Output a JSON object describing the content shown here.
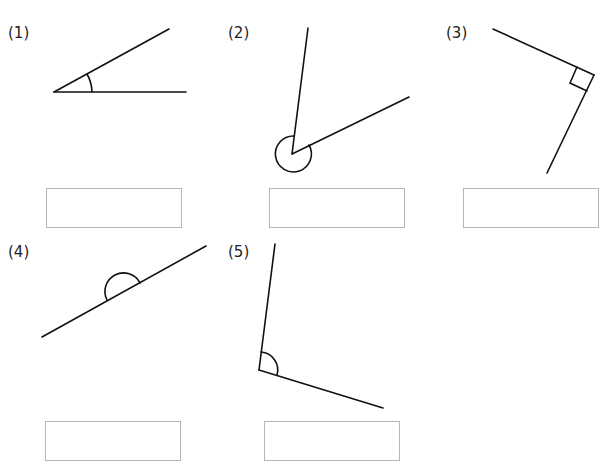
{
  "worksheet": {
    "problems": [
      {
        "number": "(1)",
        "angle_type": "acute",
        "answer": ""
      },
      {
        "number": "(2)",
        "angle_type": "reflex",
        "answer": ""
      },
      {
        "number": "(3)",
        "angle_type": "right",
        "answer": ""
      },
      {
        "number": "(4)",
        "angle_type": "straight",
        "answer": ""
      },
      {
        "number": "(5)",
        "angle_type": "obtuse",
        "answer": ""
      }
    ]
  }
}
